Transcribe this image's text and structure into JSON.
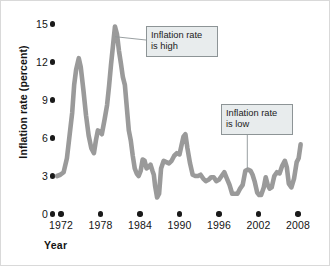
{
  "chart_data": {
    "type": "line",
    "title": "",
    "xlabel": "Year",
    "ylabel": "Inflation rate (percent)",
    "xlim": [
      1971.2,
      2009.2
    ],
    "ylim": [
      0,
      15.6
    ],
    "grid": false,
    "legend": "none",
    "xticks": [
      1972,
      1978,
      1984,
      1990,
      1996,
      2002,
      2008
    ],
    "yticks": [
      0,
      3,
      6,
      9,
      12,
      15
    ],
    "xticklabels": [
      "1972",
      "1978",
      "1984",
      "1990",
      "1996",
      "2002",
      "2008"
    ],
    "yticklabels": [
      "0",
      "3",
      "6",
      "9",
      "12",
      "15"
    ],
    "line_color": "#9a9a9a",
    "tick_marker_style": "filled-circle",
    "series": [
      {
        "name": "Inflation rate",
        "x": [
          1971.4,
          1971.9,
          1972.4,
          1972.9,
          1973.3,
          1973.7,
          1974.0,
          1974.3,
          1974.7,
          1975.0,
          1975.4,
          1975.8,
          1976.2,
          1976.6,
          1977.0,
          1977.3,
          1977.6,
          1977.9,
          1978.2,
          1978.6,
          1979.0,
          1979.3,
          1979.6,
          1979.9,
          1980.2,
          1980.5,
          1980.8,
          1981.1,
          1981.4,
          1981.7,
          1982.0,
          1982.3,
          1982.6,
          1982.9,
          1983.2,
          1983.5,
          1983.8,
          1984.1,
          1984.4,
          1984.7,
          1985.0,
          1985.3,
          1985.6,
          1985.9,
          1986.1,
          1986.3,
          1986.6,
          1986.9,
          1987.2,
          1987.6,
          1988.0,
          1988.4,
          1988.8,
          1989.2,
          1989.6,
          1990.0,
          1990.3,
          1990.6,
          1990.9,
          1991.2,
          1991.6,
          1992.0,
          1992.4,
          1992.8,
          1993.2,
          1993.6,
          1994.0,
          1994.4,
          1994.8,
          1995.2,
          1995.6,
          1996.0,
          1996.4,
          1996.8,
          1997.2,
          1997.6,
          1998.0,
          1998.4,
          1998.8,
          1999.2,
          1999.6,
          2000.0,
          2000.4,
          2000.8,
          2001.1,
          2001.4,
          2001.8,
          2002.1,
          2002.4,
          2002.8,
          2003.1,
          2003.4,
          2003.7,
          2004.0,
          2004.4,
          2004.8,
          2005.2,
          2005.6,
          2006.0,
          2006.3,
          2006.6,
          2007.0,
          2007.4,
          2007.8,
          2008.1,
          2008.4
        ],
        "y": [
          3.0,
          3.1,
          3.3,
          4.4,
          6.2,
          8.0,
          10.2,
          11.4,
          12.3,
          11.6,
          9.8,
          7.8,
          6.2,
          5.2,
          4.8,
          5.8,
          6.6,
          6.5,
          6.3,
          7.4,
          8.6,
          10.1,
          11.8,
          13.3,
          14.8,
          14.2,
          12.9,
          11.9,
          10.8,
          10.2,
          8.4,
          6.6,
          5.8,
          4.6,
          3.6,
          3.2,
          3.0,
          3.4,
          4.3,
          4.2,
          3.6,
          3.7,
          3.9,
          3.4,
          3.1,
          2.2,
          1.3,
          1.6,
          3.6,
          4.2,
          4.1,
          4.0,
          4.2,
          4.6,
          4.8,
          4.7,
          5.4,
          6.1,
          6.3,
          5.2,
          4.0,
          3.1,
          3.0,
          3.0,
          3.1,
          2.8,
          2.6,
          2.7,
          2.9,
          2.9,
          2.6,
          2.7,
          3.0,
          3.3,
          2.8,
          2.3,
          1.6,
          1.6,
          1.6,
          2.0,
          2.3,
          3.4,
          3.5,
          3.4,
          3.1,
          2.6,
          1.7,
          1.5,
          1.5,
          2.1,
          2.9,
          2.3,
          2.0,
          2.1,
          3.0,
          3.3,
          3.2,
          3.8,
          4.2,
          3.7,
          2.4,
          2.1,
          2.8,
          4.1,
          4.4,
          5.5
        ]
      }
    ],
    "annotations": [
      {
        "name": "inflation-high",
        "text_line1": "Inflation rate",
        "text_line2": "is high",
        "points_to_x": 1980.2,
        "points_to_y": 14.0
      },
      {
        "name": "inflation-low",
        "text_line1": "Inflation rate",
        "text_line2": "is low",
        "points_to_x": 2000.3,
        "points_to_y": 3.6
      }
    ]
  }
}
